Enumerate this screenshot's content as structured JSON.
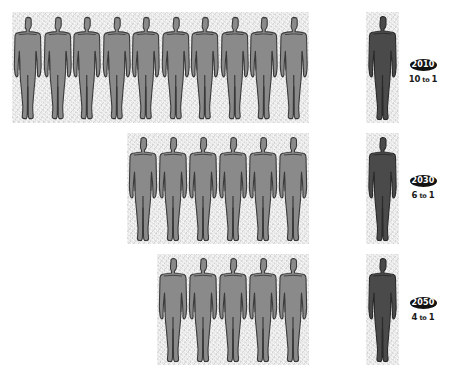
{
  "colors": {
    "worker_figure": "#8a8a8a",
    "worker_outline": "#3a3a3a",
    "retiree_figure": "#4a4a4a",
    "panel_bg": "#e4e4e4",
    "badge_bg": "#111111",
    "badge_text": "#ffffff"
  },
  "rows": [
    {
      "year": "2010",
      "ratio_number": "10",
      "ratio_to": "to",
      "ratio_denominator": "1",
      "ratio_label": "10 to 1",
      "worker_count": 10,
      "retiree_count": 1
    },
    {
      "year": "2030",
      "ratio_number": "6",
      "ratio_to": "to",
      "ratio_denominator": "1",
      "ratio_label": "6 to 1",
      "worker_count": 6,
      "retiree_count": 1
    },
    {
      "year": "2050",
      "ratio_number": "4",
      "ratio_to": "to",
      "ratio_denominator": "1",
      "ratio_label": "4 to 1",
      "worker_count": 5,
      "retiree_count": 1
    }
  ]
}
